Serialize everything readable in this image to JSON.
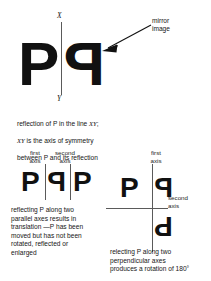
{
  "figure": {
    "background_color": "#ffffff",
    "ink_color": "#111111",
    "axis_color": "#5a5a5a"
  },
  "top_panel": {
    "original_glyph": "P",
    "mirrored_glyph": "P",
    "axis_label_top": "X",
    "axis_label_bottom": "Y",
    "annotation": "mirror\nimage",
    "arrow": "arrow-pointing-down-left"
  },
  "caption_top": {
    "line1_pre": "reflection of P in the line ",
    "line1_italic": "XY",
    "line1_post": ";",
    "line2_italic": "XY",
    "line2_post": " is the axis of symmetry",
    "line3": "between P and its reflection"
  },
  "bottom_left_panel": {
    "label_first_axis": "first\naxis",
    "label_second_axis": "second\naxis",
    "glyph_1": "P",
    "glyph_2": "P",
    "glyph_3": "P",
    "caption": "reflecting P along two\nparallel axes results in\ntranslation —P has been\nmoved but has not been\nrotated, reflected or\nenlarged"
  },
  "bottom_right_panel": {
    "label_first_axis": "first\naxis",
    "label_second_axis": "second\naxis",
    "glyph_top_left": "P",
    "glyph_top_right": "P",
    "glyph_bottom_right": "P",
    "caption": "relecting P along two\nperpendicular axes\nproduces a rotation of 180°"
  }
}
